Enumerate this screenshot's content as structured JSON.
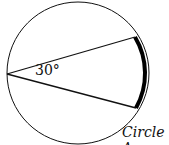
{
  "diagram": {
    "angle_label": "30°",
    "caption": "Circle A",
    "circle": {
      "cx": 78,
      "cy": 73,
      "r": 71
    },
    "vertex": [
      7,
      74
    ],
    "chord_ends": [
      [
        135,
        37
      ],
      [
        136,
        108
      ]
    ],
    "stroke_color": "#111111"
  }
}
